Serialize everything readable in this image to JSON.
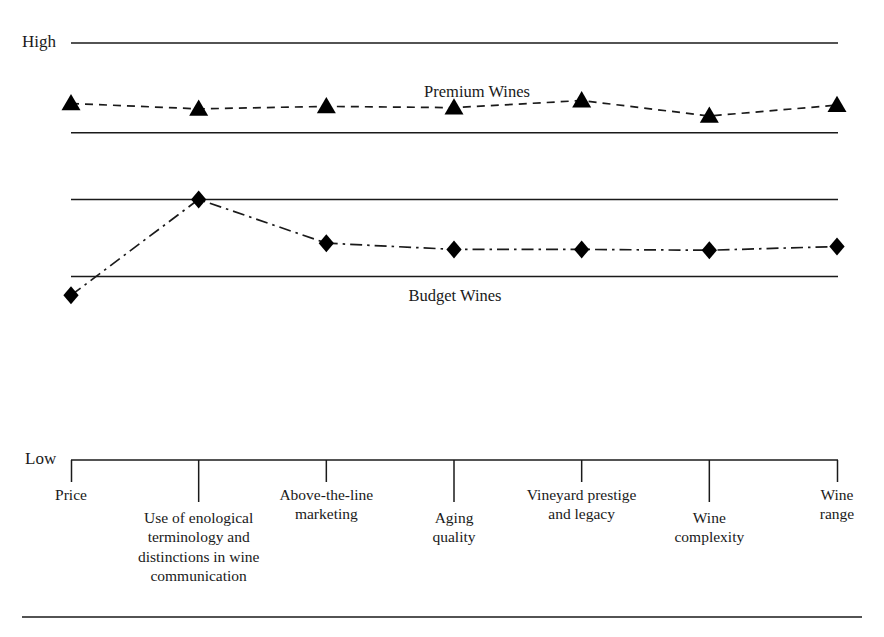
{
  "axis": {
    "high_label": "High",
    "low_label": "Low"
  },
  "series_labels": {
    "premium": "Premium Wines",
    "budget": "Budget Wines"
  },
  "chart_data": {
    "type": "line",
    "title": "",
    "subtitle": "",
    "xlabel": "",
    "ylabel": "",
    "ylim_labels": [
      "Low",
      "High"
    ],
    "grid": false,
    "legend_position": "inline-annotation",
    "categories": [
      "Price",
      "Use of enological terminology and distinctions in wine communication",
      "Above-the-line marketing",
      "Aging quality",
      "Vineyard prestige and legacy",
      "Wine complexity",
      "Wine range"
    ],
    "category_lines": [
      [
        "Price"
      ],
      [
        "Use of enological",
        "terminology and",
        "distinctions in wine",
        "communication"
      ],
      [
        "Above-the-line",
        "marketing"
      ],
      [
        "Aging",
        "quality"
      ],
      [
        "Vineyard prestige",
        "and legacy"
      ],
      [
        "Wine",
        "complexity"
      ],
      [
        "Wine",
        "range"
      ]
    ],
    "series": [
      {
        "name": "Premium Wines",
        "style": "dashed",
        "marker": "triangle",
        "values": [
          0.855,
          0.842,
          0.848,
          0.845,
          0.862,
          0.825,
          0.851
        ]
      },
      {
        "name": "Budget Wines",
        "style": "dash-dot",
        "marker": "diamond",
        "values": [
          0.395,
          0.625,
          0.52,
          0.505,
          0.505,
          0.503,
          0.512
        ]
      }
    ],
    "reference_lines": [
      1.0,
      0.785,
      0.625,
      0.44
    ],
    "colors": {
      "line": "#1a1a1a",
      "marker": "#000000",
      "background": "#ffffff",
      "text": "#1a1a1a"
    }
  }
}
